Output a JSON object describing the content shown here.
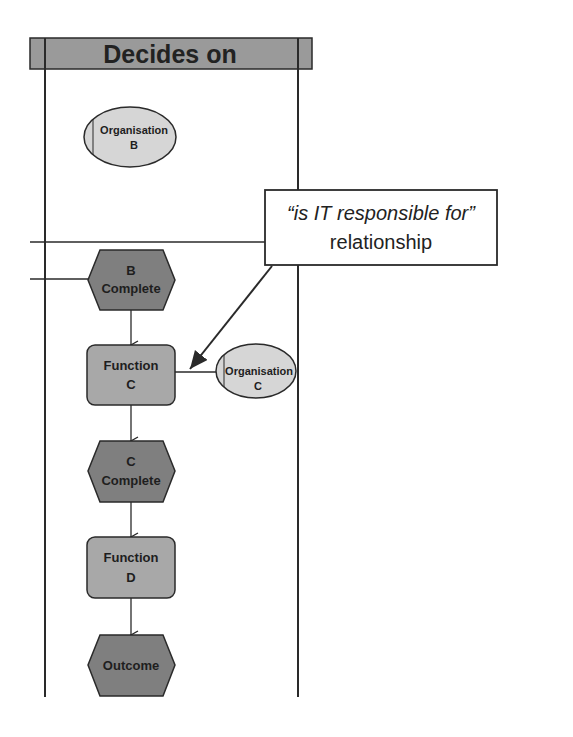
{
  "colors": {
    "background": "#ffffff",
    "line": "#2a2a2a",
    "header_fill": "#9a9a9a",
    "event_fill": "#7f7f7f",
    "function_fill": "#a8a8a8",
    "org_fill": "#d6d6d6",
    "callout_fill": "#ffffff"
  },
  "swimlane": {
    "header_label": "Decides on"
  },
  "callout": {
    "line1": "“is IT responsible for”",
    "line2": "relationship"
  },
  "nodes": {
    "org_b": {
      "type": "organisation",
      "line1": "Organisation",
      "line2": "B"
    },
    "b_complete": {
      "type": "event",
      "line1": "B",
      "line2": "Complete"
    },
    "function_c": {
      "type": "function",
      "line1": "Function",
      "line2": "C"
    },
    "org_c": {
      "type": "organisation",
      "line1": "Organisation",
      "line2": "C"
    },
    "c_complete": {
      "type": "event",
      "line1": "C",
      "line2": "Complete"
    },
    "function_d": {
      "type": "function",
      "line1": "Function",
      "line2": "D"
    },
    "outcome": {
      "type": "event",
      "line1": "Outcome"
    }
  },
  "edges": [
    {
      "from": "b_complete",
      "to": "function_c",
      "kind": "flow-arrow"
    },
    {
      "from": "function_c",
      "to": "c_complete",
      "kind": "flow-arrow"
    },
    {
      "from": "c_complete",
      "to": "function_d",
      "kind": "flow-arrow"
    },
    {
      "from": "function_d",
      "to": "outcome",
      "kind": "flow-arrow"
    },
    {
      "from": "function_c",
      "to": "org_c",
      "kind": "association"
    },
    {
      "from": "callout",
      "to": "function_c",
      "kind": "annotation-arrow"
    }
  ]
}
